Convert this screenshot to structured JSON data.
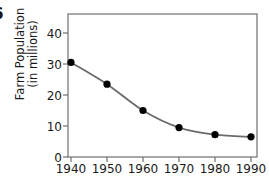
{
  "figure": {
    "letter": "6",
    "background": "#ffffff"
  },
  "chart_data": {
    "type": "line",
    "title": "",
    "xlabel": "",
    "ylabel": "Farm Population (in millions)",
    "ylabel_line1": "Farm Population",
    "ylabel_line2": "(in millions)",
    "x": [
      1940,
      1950,
      1960,
      1970,
      1980,
      1990
    ],
    "categories": [
      "1940",
      "1950",
      "1960",
      "1970",
      "1980",
      "1990"
    ],
    "values": [
      30.5,
      23.5,
      15.0,
      9.5,
      7.2,
      6.5
    ],
    "series": [
      {
        "name": "Farm Population",
        "values": [
          30.5,
          23.5,
          15.0,
          9.5,
          7.2,
          6.5
        ]
      }
    ],
    "xlim": [
      1936,
      1994
    ],
    "ylim": [
      0,
      47
    ],
    "xticks": [
      1940,
      1950,
      1960,
      1970,
      1980,
      1990
    ],
    "xtick_labels": [
      "1940",
      "1950",
      "1960",
      "1970",
      "1980",
      "1990"
    ],
    "yticks": [
      0,
      10,
      20,
      30,
      40
    ],
    "ytick_labels": [
      "0",
      "10",
      "20",
      "30",
      "40"
    ],
    "grid": false,
    "legend": false,
    "marker": "filled-circle",
    "line_color": "#6b6b6b",
    "marker_color": "#000000",
    "axis_color": "#7a7a7a"
  }
}
